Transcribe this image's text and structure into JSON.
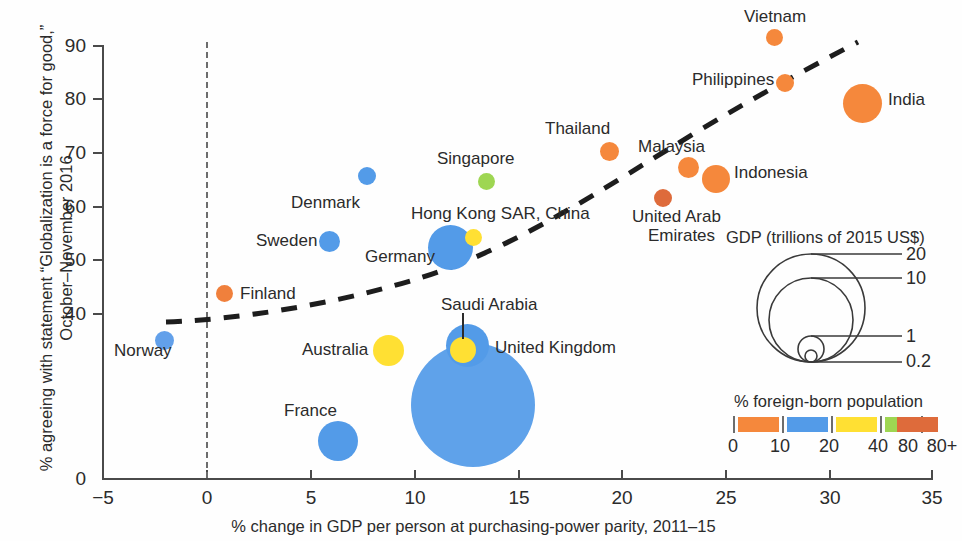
{
  "chart_data": {
    "type": "scatter",
    "title": "",
    "xlabel": "% change in GDP per person at purchasing-power parity, 2011–15",
    "ylabel": "% agreeing with statement “Globalization is a force for good,” October–November 2016",
    "xlim": [
      -5,
      35
    ],
    "ylim": [
      0,
      90
    ],
    "xticks": [
      "−5",
      "0",
      "5",
      "10",
      "15",
      "20",
      "25",
      "30",
      "35"
    ],
    "xtick_values": [
      -5,
      0,
      5,
      10,
      15,
      20,
      25,
      30,
      35
    ],
    "yticks": [
      "0",
      "40",
      "50",
      "60",
      "70",
      "80",
      "90"
    ],
    "ytick_values": [
      0,
      40,
      50,
      60,
      70,
      80,
      90
    ],
    "y_axis_break": true,
    "grid": false,
    "reference_line_x": 0,
    "bubble_size_encodes": "GDP (trillions of 2015 US$)",
    "bubble_color_encodes": "% foreign-born population",
    "trendline": {
      "style": "dashed",
      "description": "upward-curving fitted trend"
    },
    "points": [
      {
        "name": "Norway",
        "x": -2.0,
        "y": 49.0,
        "gdp": 0.39,
        "color_band": "0–10",
        "color": "#62A0EA",
        "label_pos": "below"
      },
      {
        "name": "Finland",
        "x": 0.8,
        "y": 55.5,
        "gdp": 0.23,
        "color_band": "0–10",
        "color": "#F0803C",
        "label_pos": "right"
      },
      {
        "name": "Denmark",
        "x": 8.6,
        "y": 68.0,
        "gdp": 0.3,
        "color_band": "10–20",
        "color": "#539BE8",
        "label_pos": "left"
      },
      {
        "name": "Sweden",
        "x": 7.7,
        "y": 62.5,
        "gdp": 0.5,
        "color_band": "10–20",
        "color": "#539BE8",
        "label_pos": "left"
      },
      {
        "name": "Germany",
        "x": 11.9,
        "y": 60.5,
        "gdp": 3.36,
        "color_band": "10–20",
        "color": "#539BE8",
        "label_pos": "left"
      },
      {
        "name": "Australia",
        "x": 9.0,
        "y": 48.0,
        "gdp": 1.23,
        "color_band": "20–40",
        "color": "#FFE033",
        "label_pos": "left"
      },
      {
        "name": "France",
        "x": 6.3,
        "y": 44.5,
        "gdp": 2.42,
        "color_band": "10–20",
        "color": "#539BE8",
        "label_pos": "above"
      },
      {
        "name": "Saudi Arabia",
        "x": 12.2,
        "y": 48.5,
        "gdp": 0.65,
        "color_band": "20–40",
        "color": "#FFE033",
        "label_pos": "leader-above"
      },
      {
        "name": "United Kingdom",
        "x": 12.6,
        "y": 48.2,
        "gdp": 2.86,
        "color_band": "10–20",
        "color": "#539BE8",
        "label_pos": "right"
      },
      {
        "name": "China",
        "x": 11.9,
        "y": 42.0,
        "gdp": 11.0,
        "color_band": "0–10",
        "color": "#539BE8",
        "label_pos": "none"
      },
      {
        "name": "Hong Kong SAR, China",
        "x": 13.1,
        "y": 63.0,
        "gdp": 0.31,
        "color_band": "20–40",
        "color": "#FFE033",
        "label_pos": "left"
      },
      {
        "name": "Singapore",
        "x": 13.7,
        "y": 70.7,
        "gdp": 0.3,
        "color_band": "40–80",
        "color": "#9ED652",
        "label_pos": "above"
      },
      {
        "name": "Thailand",
        "x": 19.5,
        "y": 75.5,
        "gdp": 0.4,
        "color_band": "0–10",
        "color": "#F5883C",
        "label_pos": "above"
      },
      {
        "name": "United Arab Emirates",
        "x": 22.0,
        "y": 68.8,
        "gdp": 0.37,
        "color_band": "80+",
        "color": "#DE6B3B",
        "label_pos": "below"
      },
      {
        "name": "Malaysia",
        "x": 23.1,
        "y": 73.0,
        "gdp": 0.3,
        "color_band": "0–10",
        "color": "#F5883C",
        "label_pos": "left"
      },
      {
        "name": "Indonesia",
        "x": 24.5,
        "y": 72.0,
        "gdp": 0.86,
        "color_band": "0–10",
        "color": "#F5883C",
        "label_pos": "right"
      },
      {
        "name": "Philippines",
        "x": 28.3,
        "y": 84.5,
        "gdp": 0.29,
        "color_band": "0–10",
        "color": "#F5883C",
        "label_pos": "left"
      },
      {
        "name": "Vietnam",
        "x": 27.5,
        "y": 91.5,
        "gdp": 0.19,
        "color_band": "0–10",
        "color": "#F5883C",
        "label_pos": "above"
      },
      {
        "name": "India",
        "x": 31.6,
        "y": 82.5,
        "gdp": 2.1,
        "color_band": "0–10",
        "color": "#F5883C",
        "label_pos": "right"
      }
    ]
  },
  "size_legend": {
    "title": "GDP (trillions of 2015 US$)",
    "entries": [
      {
        "label": "20"
      },
      {
        "label": "10"
      },
      {
        "label": "1"
      },
      {
        "label": "0.2"
      }
    ]
  },
  "color_legend": {
    "title": "% foreign-born population",
    "ticks": [
      "0",
      "10",
      "20",
      "40",
      "80",
      "80+"
    ],
    "swatches": [
      {
        "band": "0–10",
        "color": "#F5883C"
      },
      {
        "band": "10–20",
        "color": "#539BE8"
      },
      {
        "band": "20–40",
        "color": "#FFE033"
      },
      {
        "band": "40–80",
        "color": "#9ED652"
      },
      {
        "band": "80+",
        "color": "#DE6B3B"
      }
    ]
  }
}
